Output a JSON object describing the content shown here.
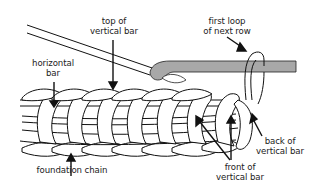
{
  "diagram": {
    "colors": {
      "line": "#111111",
      "hook": "#a8a8a8",
      "yarn": "#ffffff",
      "background": "#ffffff"
    },
    "labels": {
      "top_of_vertical_bar": {
        "line1": "top of",
        "line2": "vertical bar"
      },
      "first_loop_of_next_row": {
        "line1": "first loop",
        "line2": "of next row"
      },
      "horizontal_bar": {
        "line1": "horizontal",
        "line2": "bar"
      },
      "foundation_chain": {
        "line1": "foundation chain"
      },
      "back_of_vertical_bar": {
        "line1": "back of",
        "line2": "vertical bar"
      },
      "front_of_vertical_bar": {
        "line1": "front of",
        "line2": "vertical bar"
      }
    },
    "components": [
      "crochet-hook",
      "stitch-row",
      "foundation-chain",
      "working-loop"
    ]
  }
}
